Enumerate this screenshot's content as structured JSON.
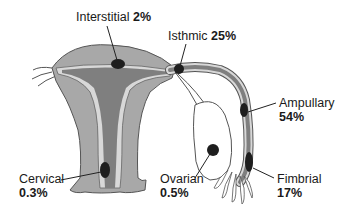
{
  "colors": {
    "uterus_wall": "#a8a8a8",
    "cavity": "#7f7f7f",
    "lining": "#d8d8d8",
    "outline": "#555555",
    "implant": "#1e1e1e",
    "ovary": "#ffffff"
  },
  "labels": {
    "interstitial": {
      "name": "Interstitial",
      "pct": "2%"
    },
    "isthmic": {
      "name": "Isthmic",
      "pct": "25%"
    },
    "ampullary": {
      "name": "Ampullary",
      "pct": "54%"
    },
    "fimbrial": {
      "name": "Fimbrial",
      "pct": "17%"
    },
    "ovarian": {
      "name": "Ovarian",
      "pct": "0.5%"
    },
    "cervical": {
      "name": "Cervical",
      "pct": "0.3%"
    }
  }
}
